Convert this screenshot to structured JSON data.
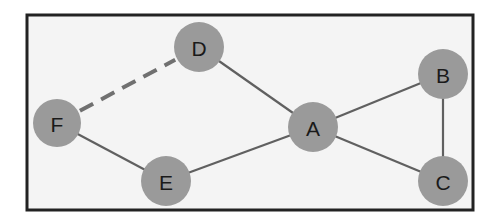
{
  "diagram": {
    "type": "undirected-graph",
    "colors": {
      "background": "#f4f4f4",
      "frame": "#222222",
      "node_fill": "#9a9a9a",
      "edge": "#606060",
      "dashed_edge": "#707070",
      "label": "#1a1a1a"
    },
    "frame": {
      "x": 27,
      "y": 15,
      "width": 446,
      "height": 195
    },
    "nodes": [
      {
        "id": "A",
        "label": "A",
        "x": 313,
        "y": 127,
        "r": 25
      },
      {
        "id": "B",
        "label": "B",
        "x": 443,
        "y": 74,
        "r": 25
      },
      {
        "id": "C",
        "label": "C",
        "x": 443,
        "y": 181,
        "r": 25
      },
      {
        "id": "D",
        "label": "D",
        "x": 199,
        "y": 47,
        "r": 25
      },
      {
        "id": "E",
        "label": "E",
        "x": 166,
        "y": 181,
        "r": 25
      },
      {
        "id": "F",
        "label": "F",
        "x": 57,
        "y": 123,
        "r": 24
      }
    ],
    "edges": [
      {
        "from": "D",
        "to": "A",
        "style": "solid"
      },
      {
        "from": "A",
        "to": "B",
        "style": "solid"
      },
      {
        "from": "B",
        "to": "C",
        "style": "solid"
      },
      {
        "from": "A",
        "to": "C",
        "style": "solid"
      },
      {
        "from": "A",
        "to": "E",
        "style": "solid"
      },
      {
        "from": "F",
        "to": "E",
        "style": "solid"
      },
      {
        "from": "F",
        "to": "D",
        "style": "dashed"
      }
    ]
  }
}
